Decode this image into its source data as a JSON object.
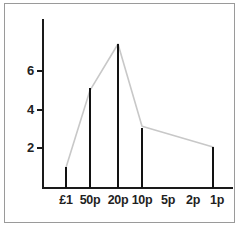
{
  "chart_data": {
    "type": "bar",
    "title": "",
    "subtitle": "",
    "xlabel": "",
    "ylabel": "",
    "categories": [
      "£1",
      "50p",
      "20p",
      "10p",
      "5p",
      "2p",
      "1p"
    ],
    "values": [
      1,
      4.75,
      7,
      3,
      null,
      null,
      2
    ],
    "series": [
      {
        "name": "coins",
        "values": [
          1,
          4.75,
          7,
          3,
          null,
          null,
          2
        ]
      }
    ],
    "ylim": [
      0,
      7.6
    ],
    "yticks": [
      2,
      4,
      6
    ],
    "ytick_labels": [
      "2",
      "4",
      "6"
    ],
    "xtick_labels": [
      "£1",
      "50p",
      "20p",
      "10p",
      "5p",
      "2p",
      "1p"
    ],
    "grid": false,
    "legend": false,
    "legend_position": "none",
    "annotations": [],
    "bar_color": "#121212",
    "line_color": "#c8c8c8",
    "axis_color": "#1a1a1a",
    "background_color": "#ffffff",
    "border_color": "#9a9a9a",
    "has_connector_line": true,
    "bars_present": [
      "£1",
      "50p",
      "20p",
      "10p",
      "1p"
    ],
    "bars_absent": [
      "5p",
      "2p"
    ]
  }
}
